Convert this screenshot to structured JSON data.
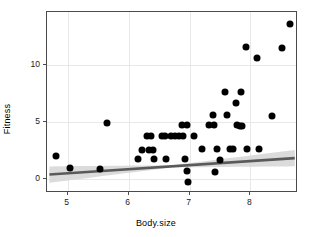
{
  "chart_data": {
    "type": "scatter",
    "title": "",
    "xlabel": "Body.size",
    "ylabel": "Fitness",
    "xlim": [
      4.66,
      8.78
    ],
    "ylim": [
      -1.2,
      14.6
    ],
    "xticks": [
      5,
      6,
      7,
      8
    ],
    "yticks": [
      0,
      5,
      10
    ],
    "grid": true,
    "legend": "none",
    "points": [
      {
        "x": 4.8,
        "y": 2.0
      },
      {
        "x": 5.03,
        "y": 0.95
      },
      {
        "x": 5.53,
        "y": 0.9
      },
      {
        "x": 5.65,
        "y": 4.9
      },
      {
        "x": 6.15,
        "y": 1.8
      },
      {
        "x": 6.22,
        "y": 2.55
      },
      {
        "x": 6.3,
        "y": 3.8
      },
      {
        "x": 6.33,
        "y": 2.55
      },
      {
        "x": 6.37,
        "y": 3.8
      },
      {
        "x": 6.4,
        "y": 2.55
      },
      {
        "x": 6.42,
        "y": 1.8
      },
      {
        "x": 6.55,
        "y": 3.8
      },
      {
        "x": 6.6,
        "y": 3.8
      },
      {
        "x": 6.62,
        "y": 1.8
      },
      {
        "x": 6.7,
        "y": 3.8
      },
      {
        "x": 6.76,
        "y": 3.8
      },
      {
        "x": 6.82,
        "y": 3.8
      },
      {
        "x": 6.88,
        "y": 4.7
      },
      {
        "x": 6.9,
        "y": 3.8
      },
      {
        "x": 6.92,
        "y": 1.75
      },
      {
        "x": 6.95,
        "y": 4.7
      },
      {
        "x": 6.96,
        "y": 0.7
      },
      {
        "x": 6.98,
        "y": -0.25
      },
      {
        "x": 7.08,
        "y": 3.8
      },
      {
        "x": 7.2,
        "y": 2.65
      },
      {
        "x": 7.32,
        "y": 4.75
      },
      {
        "x": 7.38,
        "y": 5.65
      },
      {
        "x": 7.4,
        "y": 4.7
      },
      {
        "x": 7.42,
        "y": 0.65
      },
      {
        "x": 7.45,
        "y": 2.65
      },
      {
        "x": 7.5,
        "y": 1.7
      },
      {
        "x": 7.58,
        "y": 7.65
      },
      {
        "x": 7.62,
        "y": 5.65
      },
      {
        "x": 7.66,
        "y": 2.65
      },
      {
        "x": 7.72,
        "y": 2.65
      },
      {
        "x": 7.76,
        "y": 6.7
      },
      {
        "x": 7.78,
        "y": 4.7
      },
      {
        "x": 7.82,
        "y": 4.65
      },
      {
        "x": 7.84,
        "y": 7.6
      },
      {
        "x": 7.86,
        "y": 4.65
      },
      {
        "x": 7.92,
        "y": 11.55
      },
      {
        "x": 7.95,
        "y": 2.6
      },
      {
        "x": 8.1,
        "y": 10.55
      },
      {
        "x": 8.14,
        "y": 2.6
      },
      {
        "x": 8.35,
        "y": 5.55
      },
      {
        "x": 8.52,
        "y": 11.5
      },
      {
        "x": 8.65,
        "y": 13.55
      }
    ],
    "fit_line": {
      "type": "linear-smooth",
      "x_start": 4.7,
      "y_start": 0.25,
      "x_end": 8.76,
      "y_end": 1.7,
      "color": "#5a5a5a",
      "ribbon_color": "#d9d9d9"
    },
    "panel": {
      "border_color": "#4a4a4a",
      "grid_color": "#e8e8e8",
      "background": "#ffffff",
      "point_color": "#000000"
    }
  }
}
